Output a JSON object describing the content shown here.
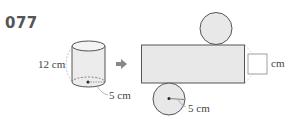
{
  "problem": {
    "number": "077"
  },
  "cylinder": {
    "height_label": "12 cm",
    "radius_label": "5 cm"
  },
  "arrow": {
    "icon": "right-arrow-icon"
  },
  "net": {
    "radius_label": "5 cm",
    "answer_unit": "cm",
    "answer_value": ""
  },
  "colors": {
    "fill": "#e8e8e8",
    "stroke": "#555555",
    "dashed": "#aaaaaa",
    "arrow": "#888888"
  }
}
